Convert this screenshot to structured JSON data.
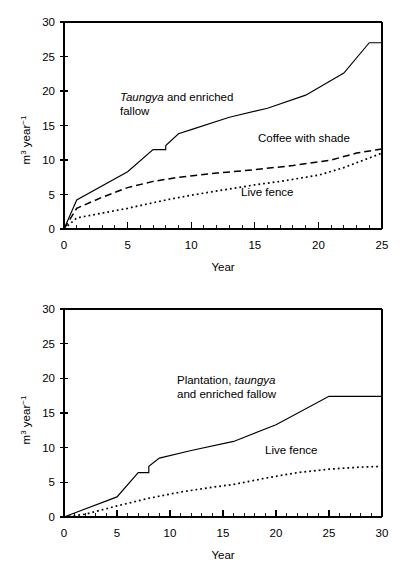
{
  "figures": [
    {
      "id": "top",
      "ylabel_main": "m",
      "ylabel_sup1": "3",
      "ylabel_mid": " year",
      "ylabel_sup2": "−1",
      "xlabel": "Year",
      "xticks": [
        0,
        5,
        10,
        15,
        20,
        25
      ],
      "yticks": [
        0,
        5,
        10,
        15,
        20,
        25,
        30
      ],
      "labels": [
        {
          "name": "taungya-label",
          "line1_italic": "Taungya",
          "line1_rest": " and enriched",
          "line2": "fallow"
        },
        {
          "name": "coffee-label",
          "text": "Coffee with shade"
        },
        {
          "name": "livefence-label",
          "text": "Live fence"
        }
      ]
    },
    {
      "id": "bottom",
      "ylabel_main": "m",
      "ylabel_sup1": "3",
      "ylabel_mid": " year",
      "ylabel_sup2": "−1",
      "xlabel": "Year",
      "xticks": [
        0,
        5,
        10,
        15,
        20,
        25,
        30
      ],
      "yticks": [
        0,
        5,
        10,
        15,
        20,
        25,
        30
      ],
      "labels": [
        {
          "name": "plantation-label",
          "line1_pre": "Plantation, ",
          "line1_italic": "taungya",
          "line2": "and enriched fallow"
        },
        {
          "name": "livefence-label",
          "text": "Live fence"
        }
      ]
    }
  ],
  "chart_data": [
    {
      "type": "line",
      "id": "top-chart",
      "title": "",
      "xlabel": "Year",
      "ylabel": "m3 year-1",
      "xlim": [
        0,
        25
      ],
      "ylim": [
        0,
        30
      ],
      "xticks": [
        0,
        5,
        10,
        15,
        20,
        25
      ],
      "yticks": [
        0,
        5,
        10,
        15,
        20,
        25,
        30
      ],
      "xminor_step": 1,
      "grid": false,
      "legend": "inline-annotations",
      "series": [
        {
          "name": "Taungya and enriched fallow",
          "style": "solid",
          "x": [
            0,
            1,
            5,
            7,
            7,
            8,
            8,
            9,
            10,
            13,
            16,
            16,
            19,
            22,
            24,
            25
          ],
          "y": [
            0,
            4.2,
            8.3,
            11.5,
            11.5,
            11.5,
            12.1,
            13.8,
            14.4,
            16.2,
            17.5,
            17.5,
            19.4,
            22.6,
            27.0,
            27.0
          ]
        },
        {
          "name": "Coffee with shade",
          "style": "dashed",
          "x": [
            0,
            1,
            3,
            5,
            7,
            9,
            12,
            15,
            18,
            21,
            23,
            25
          ],
          "y": [
            0,
            3.0,
            4.6,
            6.0,
            6.9,
            7.5,
            8.1,
            8.6,
            9.2,
            10.0,
            11.0,
            11.6
          ]
        },
        {
          "name": "Live fence",
          "style": "dotted",
          "x": [
            0,
            1,
            3,
            5,
            8,
            10,
            13,
            15,
            17,
            20,
            22,
            25
          ],
          "y": [
            0,
            1.6,
            2.3,
            3.0,
            4.2,
            4.9,
            5.8,
            6.4,
            6.9,
            7.8,
            8.9,
            11.0
          ]
        }
      ]
    },
    {
      "type": "line",
      "id": "bottom-chart",
      "title": "",
      "xlabel": "Year",
      "ylabel": "m3 year-1",
      "xlim": [
        0,
        30
      ],
      "ylim": [
        0,
        30
      ],
      "xticks": [
        0,
        5,
        10,
        15,
        20,
        25,
        30
      ],
      "yticks": [
        0,
        5,
        10,
        15,
        20,
        25,
        30
      ],
      "xminor_step": 1,
      "grid": false,
      "legend": "inline-annotations",
      "series": [
        {
          "name": "Plantation, taungya and enriched fallow",
          "style": "solid",
          "x": [
            0,
            5,
            7,
            7,
            8,
            8,
            9,
            12,
            16,
            16,
            20,
            25,
            30
          ],
          "y": [
            0,
            2.9,
            6.4,
            6.4,
            6.4,
            7.3,
            8.5,
            9.6,
            10.9,
            10.9,
            13.3,
            17.4,
            17.4
          ]
        },
        {
          "name": "Live fence",
          "style": "dotted",
          "x": [
            0,
            2,
            5,
            8,
            11,
            14,
            16,
            19,
            22,
            25,
            28,
            30
          ],
          "y": [
            0,
            0.4,
            1.6,
            2.7,
            3.6,
            4.3,
            4.7,
            5.6,
            6.4,
            6.9,
            7.2,
            7.3
          ]
        }
      ]
    }
  ]
}
